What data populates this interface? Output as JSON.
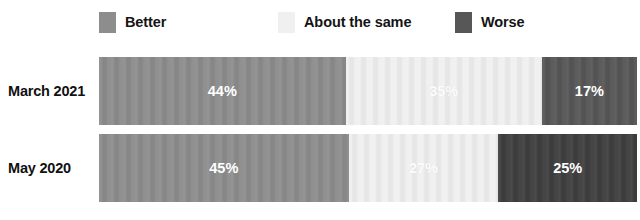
{
  "legend": {
    "items": [
      {
        "label": "Better",
        "color": "#8d8d8d",
        "swatch_name": "legend-swatch-better"
      },
      {
        "label": "About the same",
        "color": "#f0f0f0",
        "swatch_name": "legend-swatch-about-the-same"
      },
      {
        "label": "Worse",
        "color": "#575757",
        "swatch_name": "legend-swatch-worse"
      }
    ]
  },
  "chart_data": {
    "type": "bar",
    "orientation": "horizontal",
    "stacked": true,
    "normalized_percent": true,
    "title": "",
    "subtitle": "",
    "xlabel": "",
    "ylabel": "",
    "xlim": [
      0,
      100
    ],
    "grid": false,
    "legend_position": "top",
    "categories": [
      "March 2021",
      "May 2020"
    ],
    "series": [
      {
        "name": "Better",
        "color": "#8d8d8d",
        "values": [
          44,
          45
        ],
        "labels": [
          "44%",
          "45%"
        ]
      },
      {
        "name": "About the same",
        "color": "#f0f0f0",
        "values": [
          35,
          27
        ],
        "labels": [
          "35%",
          "27%"
        ]
      },
      {
        "name": "Worse",
        "color": "#575757",
        "values": [
          17,
          25
        ],
        "labels": [
          "17%",
          "25%"
        ]
      }
    ],
    "rows": [
      {
        "category": "March 2021",
        "segments": [
          {
            "name": "Better",
            "value": 44,
            "label": "44%",
            "color": "#8d8d8d"
          },
          {
            "name": "About the same",
            "value": 35,
            "label": "35%",
            "color": "#f0f0f0"
          },
          {
            "name": "Worse",
            "value": 17,
            "label": "17%",
            "color": "#575757"
          }
        ]
      },
      {
        "category": "May 2020",
        "segments": [
          {
            "name": "Better",
            "value": 45,
            "label": "45%",
            "color": "#8d8d8d"
          },
          {
            "name": "About the same",
            "value": 27,
            "label": "27%",
            "color": "#f0f0f0"
          },
          {
            "name": "Worse",
            "value": 25,
            "label": "25%",
            "color": "#3f3f3f"
          }
        ]
      }
    ]
  }
}
